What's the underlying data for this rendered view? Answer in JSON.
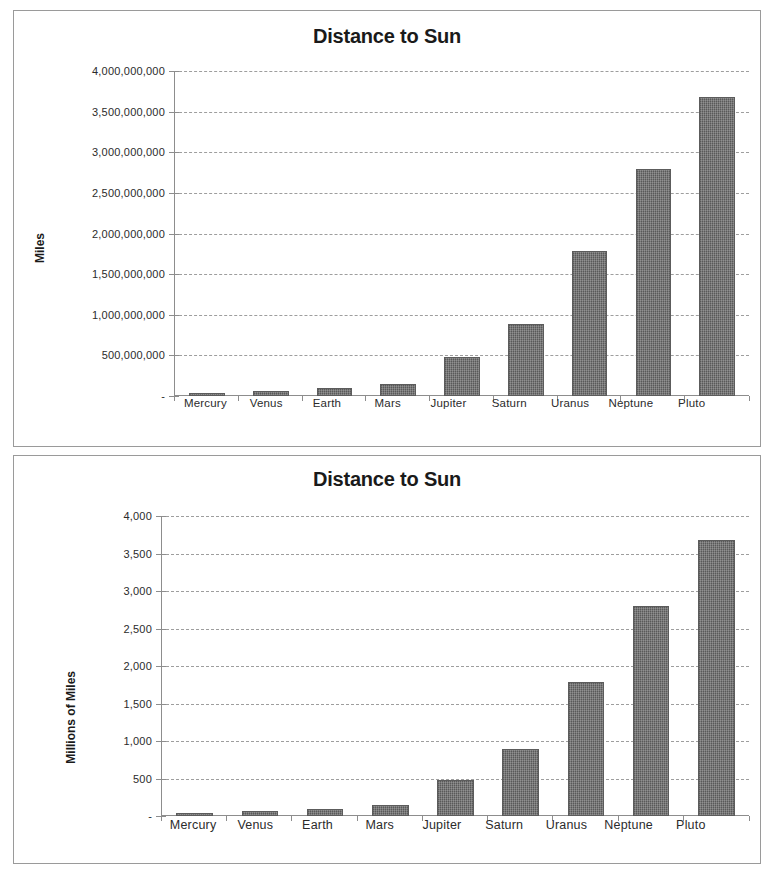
{
  "charts": [
    {
      "id": "top",
      "title": "Distance to Sun",
      "ylabel": "Miles",
      "ytick_labels": [
        "4,000,000,000",
        "3,500,000,000",
        "3,000,000,000",
        "2,500,000,000",
        "2,000,000,000",
        "1,500,000,000",
        "1,000,000,000",
        "500,000,000",
        "-"
      ],
      "categories": [
        "Mercury",
        "Venus",
        "Earth",
        "Mars",
        "Jupiter",
        "Saturn",
        "Uranus",
        "Neptune",
        "Pluto"
      ]
    },
    {
      "id": "bottom",
      "title": "Distance to Sun",
      "ylabel": "Millions of Miles",
      "ytick_labels": [
        "4,000",
        "3,500",
        "3,000",
        "2,500",
        "2,000",
        "1,500",
        "1,000",
        "500",
        "-"
      ],
      "categories": [
        "Mercury",
        "Venus",
        "Earth",
        "Mars",
        "Jupiter",
        "Saturn",
        "Uranus",
        "Neptune",
        "Pluto"
      ]
    }
  ],
  "colors": {
    "bar_fill": "#6c6c6c",
    "bar_border": "#5c5c5c",
    "gridline": "#9e9e9e",
    "axis": "#8d8d8d",
    "box_border": "#9a9a9a",
    "text": "#231f20",
    "background": "#ffffff"
  },
  "chart_data": [
    {
      "type": "bar",
      "title": "Distance to Sun",
      "xlabel": "",
      "ylabel": "Miles",
      "categories": [
        "Mercury",
        "Venus",
        "Earth",
        "Mars",
        "Jupiter",
        "Saturn",
        "Uranus",
        "Neptune",
        "Pluto"
      ],
      "values": [
        36000000,
        67000000,
        93000000,
        142000000,
        484000000,
        887000000,
        1784000000,
        2795000000,
        3675000000
      ],
      "ylim": [
        0,
        4000000000
      ],
      "yticks": [
        0,
        500000000,
        1000000000,
        1500000000,
        2000000000,
        2500000000,
        3000000000,
        3500000000,
        4000000000
      ],
      "ytick_labels": [
        "-",
        "500,000,000",
        "1,000,000,000",
        "1,500,000,000",
        "2,000,000,000",
        "2,500,000,000",
        "3,000,000,000",
        "3,500,000,000",
        "4,000,000,000"
      ],
      "grid": true,
      "legend": "none"
    },
    {
      "type": "bar",
      "title": "Distance to Sun",
      "xlabel": "",
      "ylabel": "Millions of Miles",
      "categories": [
        "Mercury",
        "Venus",
        "Earth",
        "Mars",
        "Jupiter",
        "Saturn",
        "Uranus",
        "Neptune",
        "Pluto"
      ],
      "values": [
        36,
        67,
        93,
        142,
        484,
        887,
        1784,
        2795,
        3675
      ],
      "ylim": [
        0,
        4000
      ],
      "yticks": [
        0,
        500,
        1000,
        1500,
        2000,
        2500,
        3000,
        3500,
        4000
      ],
      "ytick_labels": [
        "-",
        "500",
        "1,000",
        "1,500",
        "2,000",
        "2,500",
        "3,000",
        "3,500",
        "4,000"
      ],
      "grid": true,
      "legend": "none"
    }
  ]
}
